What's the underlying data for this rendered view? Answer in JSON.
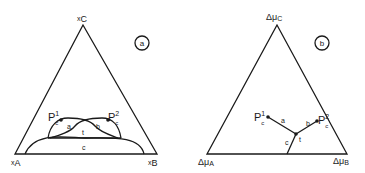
{
  "panel_a": {
    "tag": "a",
    "vertex_top": {
      "main": "x",
      "sub": "C"
    },
    "vertex_left": {
      "main": "x",
      "sub": "A"
    },
    "vertex_right": {
      "main": "x",
      "sub": "B"
    },
    "point1": {
      "main": "P",
      "sub": "c",
      "sup": "1"
    },
    "point2": {
      "main": "P",
      "sub": "c",
      "sup": "2"
    },
    "region_a": "a",
    "region_b": "b",
    "region_t": "t",
    "region_c": "c"
  },
  "panel_b": {
    "tag": "b",
    "vertex_top": {
      "main": "Δμ",
      "sub": "C"
    },
    "vertex_left": {
      "main": "Δμ",
      "sub": "A"
    },
    "vertex_right": {
      "main": "Δμ",
      "sub": "B"
    },
    "point1": {
      "main": "P",
      "sub": "c",
      "sup": "1"
    },
    "point2": {
      "main": "P",
      "sub": "c",
      "sup": "2"
    },
    "line_a": "a",
    "line_b": "b",
    "line_t": "t",
    "line_c": "c"
  }
}
